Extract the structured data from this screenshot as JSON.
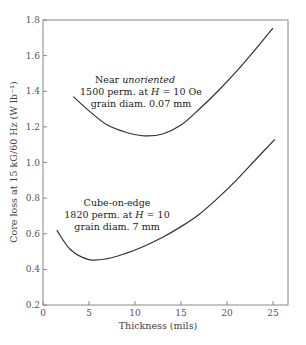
{
  "chart_data": {
    "type": "line",
    "title": "",
    "xlabel": "Thickness (mils)",
    "ylabel": "Core loss at 15 kG/60 Hz (W lb⁻¹)",
    "xlim": [
      0,
      26.6
    ],
    "ylim": [
      0.2,
      1.8
    ],
    "xticks": [
      0,
      5,
      10,
      15,
      20,
      25
    ],
    "yticks": [
      0.2,
      0.4,
      0.6,
      0.8,
      1.0,
      1.2,
      1.4,
      1.6,
      1.8
    ],
    "xtick_labels": [
      "0",
      "5",
      "10",
      "15",
      "20",
      "25"
    ],
    "ytick_labels": [
      "0.2",
      "0.4",
      "0.6",
      "0.8",
      "1.0",
      "1.2",
      "1.4",
      "1.6",
      "1.8"
    ],
    "grid": false,
    "legend": null,
    "series": [
      {
        "name": "Near unoriented",
        "x": [
          3.3,
          5,
          7,
          9,
          11,
          13,
          15,
          17,
          19,
          21,
          23,
          25
        ],
        "y": [
          1.37,
          1.29,
          1.21,
          1.17,
          1.15,
          1.16,
          1.21,
          1.3,
          1.4,
          1.51,
          1.63,
          1.755
        ]
      },
      {
        "name": "Cube-on-edge",
        "x": [
          1.5,
          3,
          5,
          7,
          9,
          11,
          13,
          15,
          17,
          19,
          21,
          23,
          25.2
        ],
        "y": [
          0.62,
          0.51,
          0.455,
          0.46,
          0.49,
          0.53,
          0.58,
          0.64,
          0.71,
          0.8,
          0.9,
          1.01,
          1.13
        ]
      }
    ],
    "annotations": [
      {
        "lines": [
          "Near ",
          "unoriented",
          "1500 perm. at ",
          "H",
          " = 10 Oe",
          "grain diam. 0.07 mm"
        ],
        "text": "Near unoriented / 1500 perm. at H = 10 Oe / grain diam. 0.07 mm"
      },
      {
        "text": "Cube-on-edge / 1820 perm. at H = 10 / grain diam. 7 mm"
      }
    ]
  },
  "labels": {
    "xlabel": "Thickness (mils)",
    "ylabel": "Core loss at 15 kG/60 Hz (W lb⁻¹)",
    "upper_line1_a": "Near ",
    "upper_line1_b": "unoriented",
    "upper_line2_a": "1500 perm. at ",
    "upper_line2_h": "H",
    "upper_line2_b": " = 10 Oe",
    "upper_line3": "grain diam. 0.07 mm",
    "lower_line1": "Cube-on-edge",
    "lower_line2_a": "1820 perm. at ",
    "lower_line2_h": "H",
    "lower_line2_b": " = 10",
    "lower_line3": "grain diam. 7 mm"
  },
  "colors": {
    "axis": "#888888",
    "curve": "#333333",
    "text": "#333333"
  }
}
